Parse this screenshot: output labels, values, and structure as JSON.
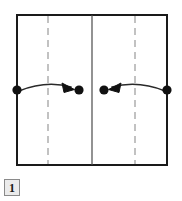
{
  "figure": {
    "label": "1",
    "caption_box": {
      "number": "1"
    },
    "colors": {
      "stroke": "#1a1a1a",
      "dashed_stroke": "#9a9a9a",
      "background": "#ffffff",
      "label_box_fill": "#ebebeb",
      "label_box_border": "#8a8a8a"
    },
    "frame": {
      "name": "outer-square",
      "x": 17,
      "y": 15,
      "width": 150,
      "height": 150
    },
    "vertical_lines": [
      {
        "name": "left-border",
        "x": 17,
        "style": "solid"
      },
      {
        "name": "left-dashed-guide",
        "x": 48,
        "style": "dashed"
      },
      {
        "name": "center-divider",
        "x": 92,
        "style": "solid"
      },
      {
        "name": "right-dashed-guide",
        "x": 135,
        "style": "dashed"
      },
      {
        "name": "right-border",
        "x": 167,
        "style": "solid"
      }
    ],
    "nodes": [
      {
        "name": "node-left-outer",
        "x": 17,
        "y": 90,
        "r": 4.5
      },
      {
        "name": "node-left-inner",
        "x": 79,
        "y": 90,
        "r": 4.5
      },
      {
        "name": "node-right-inner",
        "x": 104,
        "y": 90,
        "r": 4.5
      },
      {
        "name": "node-right-outer",
        "x": 167,
        "y": 90,
        "r": 4.5
      }
    ],
    "arrows": [
      {
        "name": "arrow-left-to-center",
        "from_x": 17,
        "from_y": 90,
        "to_x": 73,
        "to_y": 90,
        "direction": "rightward",
        "curve_control_y": 81
      },
      {
        "name": "arrow-right-to-center",
        "from_x": 167,
        "from_y": 90,
        "to_x": 110,
        "to_y": 90,
        "direction": "leftward",
        "curve_control_y": 81
      }
    ]
  }
}
